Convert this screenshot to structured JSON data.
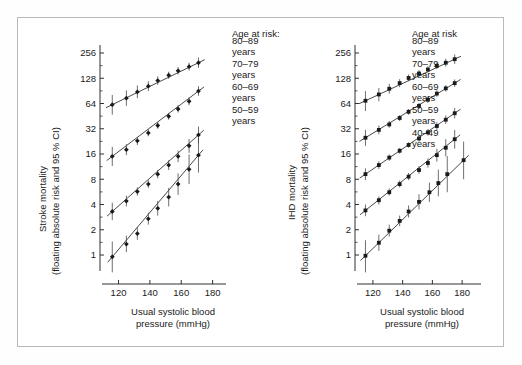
{
  "figure": {
    "background": "#ffffff",
    "border_color": "#b9b9b9",
    "ink_color": "#1a1a1a"
  },
  "panels": [
    {
      "id": "stroke",
      "ylabel_line1": "Stroke mortality",
      "ylabel_line2": "(floating absolute risk and 95 % CI)",
      "xlabel_line1": "Usual systolic blood",
      "xlabel_line2": "pressure (mmHg)",
      "legend_title": "Age at risk:",
      "legend_items": [
        {
          "range": "80–89",
          "unit": "years"
        },
        {
          "range": "70–79",
          "unit": "years"
        },
        {
          "range": "60–69",
          "unit": "years"
        },
        {
          "range": "50–59",
          "unit": "years"
        }
      ],
      "yticks": [
        "256",
        "128",
        "64",
        "32",
        "16",
        "8",
        "4",
        "2",
        "1"
      ],
      "xticks": [
        "120",
        "140",
        "160",
        "180"
      ]
    },
    {
      "id": "ihd",
      "ylabel_line1": "IHD mortality",
      "ylabel_line2": "(floating absolute risk and 95 % CI)",
      "xlabel_line1": "Usual systolic blood",
      "xlabel_line2": "pressure (mmHg)",
      "legend_title": "Age at risk",
      "legend_items": [
        {
          "range": "80–89",
          "unit": "years"
        },
        {
          "range": "70–79",
          "unit": "years"
        },
        {
          "range": "60–69",
          "unit": "years"
        },
        {
          "range": "50–59",
          "unit": "years"
        },
        {
          "range": "40–49",
          "unit": "years"
        }
      ],
      "yticks": [
        "256",
        "128",
        "64",
        "32",
        "16",
        "8",
        "4",
        "2",
        "1"
      ],
      "xticks": [
        "120",
        "140",
        "160",
        "180"
      ]
    }
  ],
  "chart_data": [
    {
      "type": "scatter",
      "panel": "stroke",
      "title": "Stroke mortality",
      "xlabel": "Usual systolic blood pressure (mmHg)",
      "ylabel": "Stroke mortality (floating absolute risk and 95 % CI)",
      "yscale": "log2",
      "ylim": [
        0.7,
        330
      ],
      "yticks": [
        1,
        2,
        4,
        8,
        16,
        32,
        64,
        128,
        256
      ],
      "xlim": [
        112,
        186
      ],
      "xticks": [
        120,
        140,
        160,
        180
      ],
      "grid": false,
      "legend_position": "right",
      "marker": "diamond",
      "series": [
        {
          "name": "80–89 years",
          "x": [
            116,
            125,
            132,
            139,
            145,
            152,
            158,
            165,
            171
          ],
          "y": [
            62,
            74,
            88,
            103,
            120,
            139,
            157,
            176,
            196
          ],
          "ci_low": [
            47,
            60,
            74,
            90,
            107,
            126,
            142,
            158,
            170
          ],
          "ci_high": [
            81,
            92,
            105,
            118,
            135,
            153,
            174,
            196,
            226
          ]
        },
        {
          "name": "70–79 years",
          "x": [
            116,
            125,
            132,
            139,
            145,
            152,
            158,
            165,
            171
          ],
          "y": [
            15.0,
            18.0,
            23.0,
            28.5,
            35.0,
            45.0,
            55.0,
            68.0,
            90.0
          ],
          "ci_low": [
            11.5,
            15.5,
            20.5,
            26.0,
            32.0,
            41.0,
            50.0,
            61.0,
            79.0
          ],
          "ci_high": [
            19.5,
            21.0,
            25.5,
            31.5,
            38.5,
            49.5,
            61.0,
            76.0,
            103.0
          ]
        },
        {
          "name": "60–69 years",
          "x": [
            116,
            125,
            132,
            139,
            145,
            152,
            158,
            165,
            171
          ],
          "y": [
            3.3,
            4.4,
            5.7,
            7.0,
            9.2,
            11.8,
            15.0,
            20.0,
            27.0
          ],
          "ci_low": [
            2.6,
            3.8,
            5.1,
            6.3,
            8.2,
            10.3,
            12.8,
            16.5,
            21.5
          ],
          "ci_high": [
            4.2,
            5.1,
            6.4,
            7.8,
            10.3,
            13.5,
            17.6,
            24.2,
            34.0
          ]
        },
        {
          "name": "50–59 years",
          "x": [
            116,
            125,
            132,
            139,
            145,
            152,
            158,
            165,
            171
          ],
          "y": [
            0.95,
            1.35,
            1.8,
            2.7,
            3.6,
            4.9,
            7.0,
            10.5,
            15.5
          ],
          "ci_low": [
            0.62,
            1.08,
            1.52,
            2.3,
            2.95,
            3.8,
            5.2,
            7.0,
            9.6
          ],
          "ci_high": [
            1.45,
            1.7,
            2.15,
            3.2,
            4.4,
            6.3,
            9.4,
            15.8,
            25.0
          ]
        }
      ]
    },
    {
      "type": "scatter",
      "panel": "ihd",
      "title": "IHD mortality",
      "xlabel": "Usual systolic blood pressure (mmHg)",
      "ylabel": "IHD mortality (floating absolute risk and 95 % CI)",
      "yscale": "log2",
      "ylim": [
        0.7,
        330
      ],
      "yticks": [
        1,
        2,
        4,
        8,
        16,
        32,
        64,
        128,
        256
      ],
      "xlim": [
        112,
        190
      ],
      "xticks": [
        120,
        140,
        160,
        180
      ],
      "grid": false,
      "legend_position": "right",
      "marker": "square",
      "series": [
        {
          "name": "80–89 years",
          "x": [
            115,
            124,
            131,
            138,
            144,
            151,
            157,
            163,
            169,
            175
          ],
          "y": [
            69,
            82,
            96,
            112,
            129,
            146,
            163,
            180,
            196,
            216
          ],
          "ci_low": [
            52,
            68,
            84,
            100,
            118,
            134,
            150,
            164,
            176,
            190
          ],
          "ci_high": [
            90,
            98,
            110,
            125,
            142,
            160,
            178,
            198,
            219,
            246
          ]
        },
        {
          "name": "70–79 years",
          "x": [
            115,
            124,
            131,
            138,
            144,
            151,
            157,
            163,
            169,
            175
          ],
          "y": [
            25.0,
            31.0,
            36.0,
            43.0,
            51.0,
            60.0,
            71.0,
            84.0,
            97.0,
            112.0
          ],
          "ci_low": [
            20.0,
            27.5,
            33.0,
            39.5,
            47.0,
            55.0,
            65.0,
            77.0,
            89.0,
            101.0
          ],
          "ci_high": [
            31.0,
            35.0,
            39.5,
            46.5,
            55.0,
            65.0,
            77.5,
            92.0,
            106.0,
            124.0
          ]
        },
        {
          "name": "60–69 years",
          "x": [
            115,
            124,
            131,
            138,
            144,
            151,
            157,
            163,
            169,
            175
          ],
          "y": [
            9.2,
            11.8,
            14.5,
            17.5,
            20.5,
            24.5,
            29.0,
            34.5,
            41.0,
            49.0
          ],
          "ci_low": [
            7.8,
            10.6,
            13.3,
            16.2,
            19.0,
            22.5,
            26.5,
            31.0,
            36.5,
            42.5
          ],
          "ci_high": [
            10.8,
            13.1,
            15.8,
            18.9,
            22.1,
            26.7,
            31.8,
            38.4,
            46.0,
            56.5
          ]
        },
        {
          "name": "50–59 years",
          "x": [
            115,
            124,
            131,
            138,
            144,
            151,
            157,
            163,
            169,
            175
          ],
          "y": [
            3.4,
            4.5,
            5.6,
            7.0,
            8.6,
            10.3,
            12.5,
            15.5,
            19.0,
            24.0
          ],
          "ci_low": [
            2.9,
            4.0,
            5.1,
            6.4,
            7.8,
            9.3,
            11.0,
            13.0,
            15.0,
            18.5
          ],
          "ci_high": [
            4.0,
            5.0,
            6.2,
            7.7,
            9.5,
            11.5,
            14.2,
            18.5,
            24.0,
            31.0
          ]
        },
        {
          "name": "40–49 years",
          "x": [
            115,
            124,
            131,
            138,
            144,
            151,
            158,
            164,
            170,
            181
          ],
          "y": [
            0.98,
            1.4,
            1.95,
            2.55,
            3.3,
            4.3,
            5.6,
            7.2,
            9.2,
            13.5
          ],
          "ci_low": [
            0.62,
            1.12,
            1.66,
            2.2,
            2.8,
            3.5,
            4.3,
            5.0,
            5.6,
            8.0
          ],
          "ci_high": [
            1.5,
            1.75,
            2.3,
            2.95,
            3.9,
            5.3,
            7.3,
            10.4,
            15.1,
            22.5
          ]
        }
      ]
    }
  ]
}
